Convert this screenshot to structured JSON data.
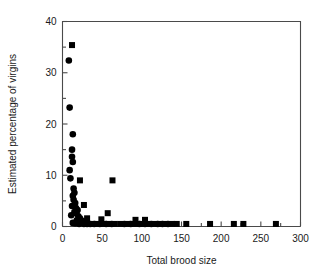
{
  "chart_data": {
    "type": "scatter",
    "title": "",
    "xlabel": "Total brood size",
    "ylabel": "Estimated percentage of virgins",
    "xlim": [
      0,
      300
    ],
    "ylim": [
      0,
      40
    ],
    "xticks": [
      0,
      50,
      100,
      150,
      200,
      250,
      300
    ],
    "xtick_labels": [
      "0",
      "50",
      "100",
      "150",
      "200",
      "250",
      "300"
    ],
    "xminor_ticks": [
      25,
      75,
      125,
      175,
      225,
      275
    ],
    "yticks": [
      0,
      10,
      20,
      30,
      40
    ],
    "ytick_labels": [
      "0",
      "10",
      "20",
      "30",
      "40"
    ],
    "yminor_ticks": [
      5,
      15,
      25,
      35
    ],
    "grid": false,
    "legend": false,
    "series": [
      {
        "name": "circles",
        "marker": "circle",
        "color": "#000000",
        "points": [
          [
            8,
            32.4
          ],
          [
            9,
            23.2
          ],
          [
            13,
            18.0
          ],
          [
            12,
            15.0
          ],
          [
            12,
            13.6
          ],
          [
            13,
            12.6
          ],
          [
            9,
            11.0
          ],
          [
            10,
            9.4
          ],
          [
            14,
            7.4
          ],
          [
            15,
            6.6
          ],
          [
            13,
            6.0
          ],
          [
            14,
            5.2
          ],
          [
            16,
            4.6
          ],
          [
            12,
            4.0
          ],
          [
            17,
            3.6
          ],
          [
            19,
            3.2
          ],
          [
            15,
            2.8
          ],
          [
            11,
            2.2
          ],
          [
            20,
            2.0
          ],
          [
            22,
            1.6
          ],
          [
            18,
            1.2
          ],
          [
            25,
            1.1
          ],
          [
            13,
            0.7
          ],
          [
            16,
            0.6
          ],
          [
            21,
            0.5
          ],
          [
            27,
            0.5
          ],
          [
            31,
            0.5
          ],
          [
            35,
            0.5
          ],
          [
            40,
            0.5
          ],
          [
            47,
            0.5
          ],
          [
            55,
            0.5
          ],
          [
            62,
            0.5
          ],
          [
            78,
            0.5
          ],
          [
            86,
            0.5
          ],
          [
            97,
            0.5
          ],
          [
            104,
            0.5
          ],
          [
            112,
            0.5
          ],
          [
            120,
            0.5
          ],
          [
            126,
            0.5
          ],
          [
            133,
            0.5
          ]
        ]
      },
      {
        "name": "squares",
        "marker": "square",
        "color": "#000000",
        "points": [
          [
            12,
            35.4
          ],
          [
            22,
            9.0
          ],
          [
            63,
            9.0
          ],
          [
            27,
            4.2
          ],
          [
            57,
            2.6
          ],
          [
            18,
            2.6
          ],
          [
            31,
            1.6
          ],
          [
            49,
            1.4
          ],
          [
            92,
            1.3
          ],
          [
            104,
            1.3
          ],
          [
            30,
            0.5
          ],
          [
            38,
            0.5
          ],
          [
            44,
            0.5
          ],
          [
            52,
            0.5
          ],
          [
            58,
            0.5
          ],
          [
            66,
            0.5
          ],
          [
            73,
            0.5
          ],
          [
            82,
            0.5
          ],
          [
            88,
            0.5
          ],
          [
            95,
            0.5
          ],
          [
            100,
            0.5
          ],
          [
            108,
            0.5
          ],
          [
            116,
            0.5
          ],
          [
            123,
            0.5
          ],
          [
            130,
            0.5
          ],
          [
            138,
            0.5
          ],
          [
            144,
            0.5
          ],
          [
            156,
            0.5
          ],
          [
            186,
            0.5
          ],
          [
            216,
            0.5
          ],
          [
            228,
            0.5
          ],
          [
            269,
            0.5
          ]
        ]
      }
    ]
  }
}
